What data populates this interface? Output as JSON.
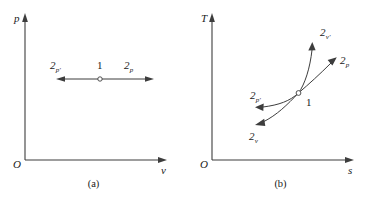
{
  "figure": {
    "stroke_color": "#3d3d3d",
    "text_color": "#1a1a1a"
  },
  "panel_a": {
    "caption": "(a)",
    "origin_label": "O",
    "y_axis_label": "p",
    "x_axis_label": "v",
    "point_label": "1",
    "left_label_base": "2",
    "left_label_sub": "p′",
    "right_label_base": "2",
    "right_label_sub": "p"
  },
  "panel_b": {
    "caption": "(b)",
    "origin_label": "O",
    "y_axis_label": "T",
    "x_axis_label": "s",
    "point_label": "1",
    "curves": [
      {
        "name": "curve-2-v-prime",
        "label_base": "2",
        "label_sub": "v′"
      },
      {
        "name": "curve-2-p",
        "label_base": "2",
        "label_sub": "p"
      },
      {
        "name": "curve-2-p-prime",
        "label_base": "2",
        "label_sub": "p′"
      },
      {
        "name": "curve-2-v",
        "label_base": "2",
        "label_sub": "v"
      }
    ]
  }
}
